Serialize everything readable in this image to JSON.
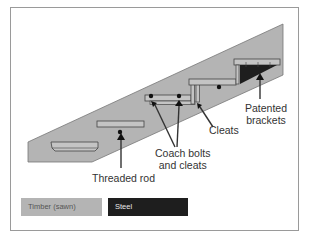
{
  "diagram": {
    "colors": {
      "timber": "#b4b4b4",
      "steel": "#1e1e1e",
      "outline": "#555555",
      "frame": "#9a9a9a"
    },
    "labels": {
      "threaded_rod": "Threaded rod",
      "coach_bolts_line1": "Coach bolts",
      "coach_bolts_line2": "and cleats",
      "cleats": "Cleats",
      "patented_line1": "Patented",
      "patented_line2": "brackets"
    },
    "legend": [
      {
        "label": "Timber (sawn)",
        "color": "#b4b4b4"
      },
      {
        "label": "Steel",
        "color": "#1e1e1e"
      }
    ]
  }
}
